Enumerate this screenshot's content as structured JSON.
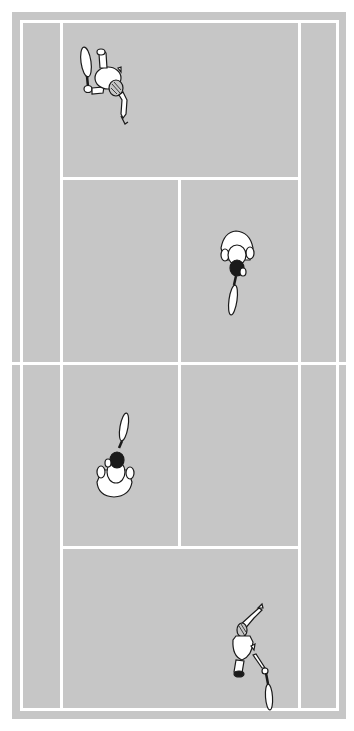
{
  "scene": {
    "title": "Tennis doubles court (top view)",
    "colors": {
      "court": "#c6c6c6",
      "lines": "#ffffff",
      "outline": "#1a1a1a",
      "player_fill": "#ffffff",
      "hair": "#1a1a1a"
    },
    "court": {
      "type": "doubles",
      "regions": [
        "doubles-alley-left",
        "doubles-alley-right",
        "service-box-top-left",
        "service-box-top-right",
        "service-box-bottom-left",
        "service-box-bottom-right",
        "backcourt-top",
        "backcourt-bottom"
      ]
    },
    "players": [
      {
        "id": "player-top-baseline",
        "position": "far baseline, left side",
        "action": "serving, racket raised"
      },
      {
        "id": "player-top-net",
        "position": "far court, right service box",
        "action": "at net, racket down"
      },
      {
        "id": "player-bottom-net",
        "position": "near court, left service box",
        "action": "at net, racket up"
      },
      {
        "id": "player-bottom-baseline",
        "position": "near baseline, right side",
        "action": "serving, arm raised"
      }
    ]
  }
}
